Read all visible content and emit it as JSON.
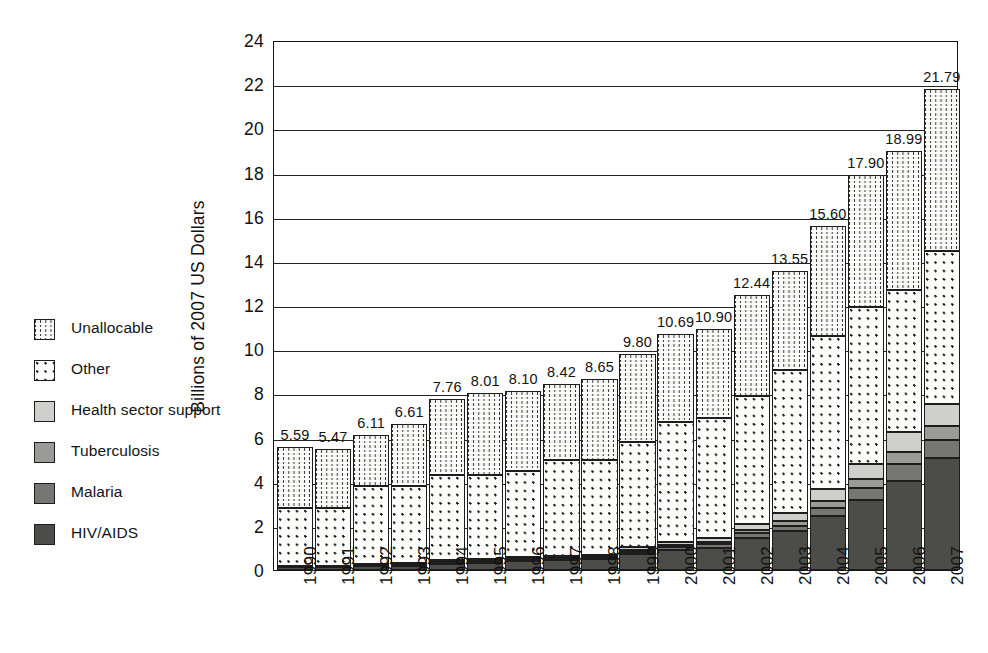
{
  "chart_data": {
    "type": "bar",
    "subtype": "stacked-bar",
    "title": "",
    "xlabel": "",
    "ylabel": "Billions of 2007 US Dollars",
    "ylim": [
      0,
      24
    ],
    "ytick_step": 2,
    "yticks": [
      "24",
      "22",
      "20",
      "18",
      "16",
      "14",
      "12",
      "10",
      "8",
      "6",
      "4",
      "2",
      "0"
    ],
    "grid": "horizontal",
    "legend_position": "left-outside",
    "categories": [
      "1990",
      "1991",
      "1992",
      "1993",
      "1994",
      "1995",
      "1996",
      "1997",
      "1998",
      "1999",
      "2000",
      "2001",
      "2002",
      "2003",
      "2004",
      "2005",
      "2006",
      "2007"
    ],
    "totals": [
      5.59,
      5.47,
      6.11,
      6.61,
      7.76,
      8.01,
      8.1,
      8.42,
      8.65,
      9.8,
      10.69,
      10.9,
      12.44,
      13.55,
      15.6,
      17.9,
      18.99,
      21.79
    ],
    "total_labels": [
      "5.59",
      "5.47",
      "6.11",
      "6.61",
      "7.76",
      "8.01",
      "8.10",
      "8.42",
      "8.65",
      "9.80",
      "10.69",
      "10.90",
      "12.44",
      "13.55",
      "15.60",
      "17.90",
      "18.99",
      "21.79"
    ],
    "series": [
      {
        "name": "HIV/AIDS",
        "pattern": "solid-dark",
        "color": "#4c4c49",
        "values": [
          0.12,
          0.12,
          0.16,
          0.18,
          0.28,
          0.34,
          0.42,
          0.45,
          0.48,
          0.72,
          0.9,
          1.0,
          1.45,
          1.75,
          2.45,
          3.15,
          4.05,
          5.05
        ]
      },
      {
        "name": "Malaria",
        "pattern": "solid-medium",
        "color": "#767672",
        "values": [
          0.03,
          0.03,
          0.04,
          0.04,
          0.06,
          0.06,
          0.07,
          0.07,
          0.08,
          0.1,
          0.14,
          0.16,
          0.22,
          0.26,
          0.38,
          0.55,
          0.75,
          0.85
        ]
      },
      {
        "name": "Tuberculosis",
        "pattern": "solid-light-grey",
        "color": "#9a9a96",
        "values": [
          0.02,
          0.02,
          0.03,
          0.03,
          0.04,
          0.04,
          0.05,
          0.05,
          0.06,
          0.08,
          0.1,
          0.12,
          0.16,
          0.2,
          0.3,
          0.42,
          0.55,
          0.6
        ]
      },
      {
        "name": "Health sector support",
        "pattern": "light-fill",
        "color": "#cfcfcc",
        "values": [
          0.03,
          0.03,
          0.04,
          0.05,
          0.06,
          0.06,
          0.07,
          0.08,
          0.08,
          0.12,
          0.15,
          0.18,
          0.25,
          0.35,
          0.52,
          0.7,
          0.9,
          1.0
        ]
      },
      {
        "name": "Other",
        "pattern": "dots",
        "color": "#fdfdfc",
        "values": [
          2.6,
          2.6,
          3.53,
          3.5,
          3.86,
          3.8,
          3.89,
          4.35,
          4.3,
          4.78,
          5.41,
          5.44,
          5.82,
          6.49,
          6.95,
          7.08,
          6.45,
          6.95
        ]
      },
      {
        "name": "Unallocable",
        "pattern": "vertical-dashes",
        "color": "#f3f3f0",
        "values": [
          2.79,
          2.67,
          2.31,
          2.81,
          3.46,
          3.71,
          3.6,
          3.42,
          3.65,
          4.0,
          3.99,
          4.0,
          4.54,
          4.5,
          5.0,
          6.0,
          6.29,
          7.34
        ]
      }
    ]
  },
  "legend": {
    "items": [
      {
        "label": "Unallocable",
        "swatch": "pat-unallocable"
      },
      {
        "label": "Other",
        "swatch": "pat-other"
      },
      {
        "label": "Health sector support",
        "swatch": "pat-health"
      },
      {
        "label": "Tuberculosis",
        "swatch": "pat-tb"
      },
      {
        "label": "Malaria",
        "swatch": "pat-malaria"
      },
      {
        "label": "HIV/AIDS",
        "swatch": "pat-hiv"
      }
    ]
  }
}
